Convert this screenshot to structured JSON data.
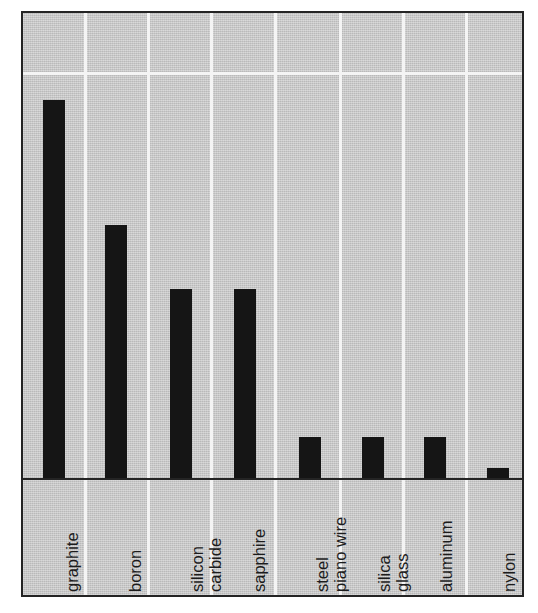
{
  "chart_data": {
    "type": "bar",
    "title": "",
    "subtitle": "",
    "xlabel": "",
    "ylabel": "",
    "categories": [
      "graphite",
      "boron",
      "silicon\ncarbide",
      "sapphire",
      "steel\npiano wire",
      "silica\nglass",
      "aluminum",
      "nylon"
    ],
    "values": [
      381,
      255,
      191,
      191,
      41,
      41,
      41,
      10
    ],
    "ylim": [
      0,
      469
    ],
    "grid": "major-vertical-and-one-horizontal",
    "legend": "none",
    "tick_labels_y": [],
    "annotations": []
  },
  "style": {
    "background_color": "#c9c9c9",
    "bar_color": "#151515",
    "grid_color": "#f4f4f4",
    "axis_color": "#242424",
    "frame_color": "#242424",
    "page_color": "#ffffff"
  },
  "layout": {
    "gridlines_x": [
      61,
      124,
      187,
      251,
      316,
      379,
      442
    ],
    "gridline_y": 61,
    "bar_positions": [
      20,
      82,
      147,
      211,
      276,
      339,
      401,
      464
    ],
    "bar_width": 22
  }
}
